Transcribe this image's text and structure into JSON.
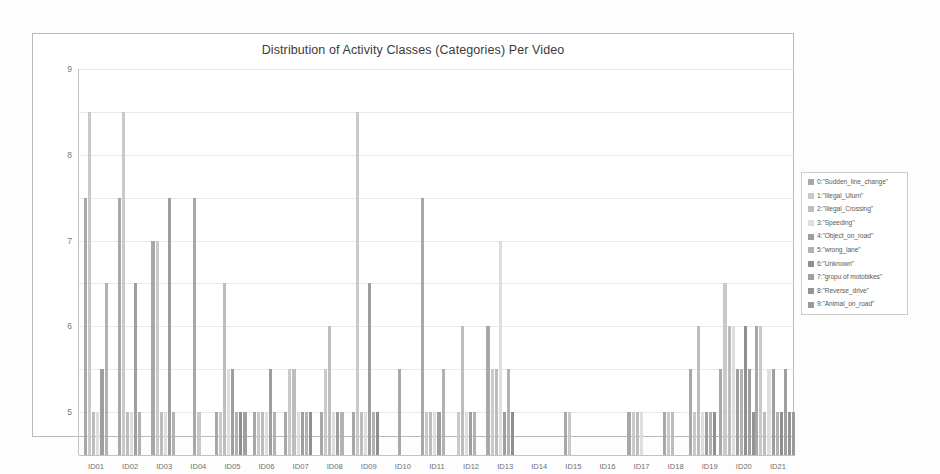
{
  "chart_data": {
    "type": "bar",
    "title": "Distribution of Activity Classes (Categories) Per Video",
    "xlabel": "",
    "ylabel": "",
    "ylim": [
      0,
      9
    ],
    "yticks": [
      0,
      1,
      2,
      3,
      4,
      5,
      6,
      7,
      8,
      9
    ],
    "grid": true,
    "legend_position": "right",
    "categories": [
      "ID01",
      "ID02",
      "ID03",
      "ID04",
      "ID05",
      "ID06",
      "ID07",
      "ID08",
      "ID09",
      "ID10",
      "ID11",
      "ID12",
      "ID13",
      "ID14",
      "ID15",
      "ID16",
      "ID17",
      "ID18",
      "ID19",
      "ID20",
      "ID21"
    ],
    "series": [
      {
        "name": "0:\"Sudden_line_change\"",
        "color": "#a8a8a8",
        "values": [
          6,
          6,
          5,
          6,
          1,
          1,
          1,
          1,
          1,
          2,
          6,
          0,
          3,
          0,
          1,
          0,
          1,
          1,
          2,
          2,
          3
        ]
      },
      {
        "name": "1:\"Illegal_Uturn\"",
        "color": "#c9c9c9",
        "values": [
          8,
          8,
          5,
          1,
          1,
          1,
          2,
          2,
          8,
          0,
          1,
          1,
          2,
          0,
          1,
          0,
          1,
          1,
          1,
          4,
          3
        ]
      },
      {
        "name": "2:\"Illegal_Crossing\"",
        "color": "#bdbdbd",
        "values": [
          1,
          1,
          1,
          0,
          4,
          1,
          2,
          3,
          1,
          0,
          1,
          3,
          2,
          0,
          0,
          0,
          1,
          1,
          3,
          3,
          1
        ]
      },
      {
        "name": "3:\"Speeding\"",
        "color": "#dedede",
        "values": [
          1,
          1,
          1,
          0,
          2,
          1,
          1,
          1,
          1,
          0,
          1,
          1,
          5,
          0,
          0,
          0,
          1,
          0,
          1,
          3,
          2
        ]
      },
      {
        "name": "4:\"Object_on_road\"",
        "color": "#9e9e9e",
        "values": [
          2,
          4,
          6,
          0,
          2,
          2,
          1,
          1,
          4,
          0,
          1,
          1,
          1,
          0,
          0,
          0,
          0,
          0,
          1,
          2,
          2
        ]
      },
      {
        "name": "5:\"wrong_lane\"",
        "color": "#b2b2b2",
        "values": [
          4,
          1,
          1,
          0,
          1,
          1,
          1,
          1,
          1,
          0,
          2,
          1,
          2,
          0,
          0,
          0,
          0,
          0,
          1,
          2,
          1
        ]
      },
      {
        "name": "6:\"Unknown\"",
        "color": "#8f8f8f",
        "values": [
          0,
          0,
          0,
          0,
          1,
          0,
          1,
          0,
          1,
          0,
          0,
          0,
          1,
          0,
          0,
          0,
          0,
          0,
          1,
          3,
          1
        ]
      },
      {
        "name": "7:\"gropu of motobikes\"",
        "color": "#a0a0a0",
        "values": [
          0,
          0,
          0,
          0,
          1,
          0,
          0,
          0,
          0,
          0,
          0,
          0,
          0,
          0,
          0,
          0,
          0,
          0,
          0,
          2,
          2
        ]
      },
      {
        "name": "8:\"Reverse_drive\"",
        "color": "#949494",
        "values": [
          0,
          0,
          0,
          0,
          0,
          0,
          0,
          0,
          0,
          0,
          0,
          0,
          0,
          0,
          0,
          0,
          0,
          0,
          0,
          1,
          1
        ]
      },
      {
        "name": "9:\"Animal_on_road\"",
        "color": "#9a9a9a",
        "values": [
          0,
          0,
          0,
          0,
          0,
          0,
          0,
          0,
          0,
          0,
          0,
          0,
          0,
          0,
          0,
          0,
          0,
          0,
          0,
          0,
          1
        ]
      }
    ]
  },
  "legend": {
    "items": [
      {
        "label": "0:\"Sudden_line_change\""
      },
      {
        "label": "1:\"Illegal_Uturn\""
      },
      {
        "label": "2:\"Illegal_Crossing\""
      },
      {
        "label": "3:\"Speeding\""
      },
      {
        "label": "4:\"Object_on_road\""
      },
      {
        "label": "5:\"wrong_lane\""
      },
      {
        "label": "6:\"Unknown\""
      },
      {
        "label": "7:\"gropu of motobikes\""
      },
      {
        "label": "8:\"Reverse_drive\""
      },
      {
        "label": "9:\"Animal_on_road\""
      }
    ]
  }
}
